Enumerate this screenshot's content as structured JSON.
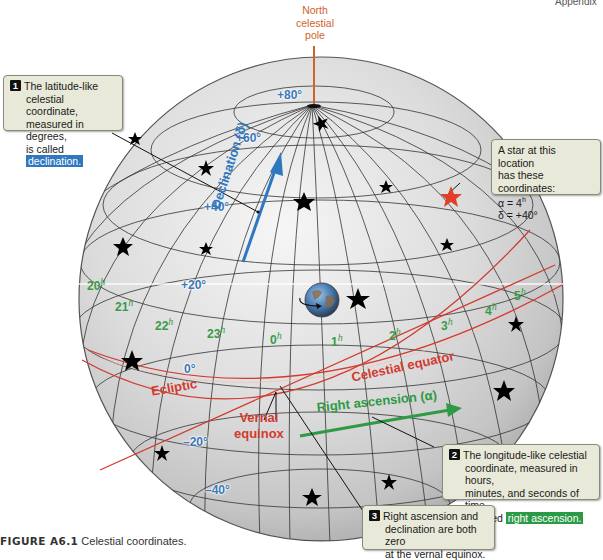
{
  "header": {
    "corner_text": "Appendix"
  },
  "pole": {
    "label_line1": "North",
    "label_line2": "celestial",
    "label_line3": "pole"
  },
  "callouts": {
    "c1": {
      "number": "1",
      "line1": "The latitude-like",
      "line2": "celestial coordinate,",
      "line3": "measured in degrees,",
      "line4_prefix": "is called ",
      "term": "declination."
    },
    "star": {
      "line1": "A star at this location",
      "line2": "has these coordinates:",
      "alpha": "α = 4",
      "alpha_sup": "h",
      "delta": "δ = +40°"
    },
    "c2": {
      "number": "2",
      "line1": "The longitude-like celestial",
      "line2": "coordinate, measured in hours,",
      "line3": "minutes, and seconds of time,",
      "line4_prefix": "is called ",
      "term": "right ascension."
    },
    "c3": {
      "number": "3",
      "line1": "Right ascension and",
      "line2": "declination are both zero",
      "line3": "at the vernal equinox."
    }
  },
  "declination_labels": {
    "p80": "+80°",
    "p60": "+60°",
    "p40": "+40°",
    "p20": "+20°",
    "z0": "0°",
    "m20": "–20°",
    "m40": "–40°"
  },
  "hour_labels": {
    "h20": "20",
    "h21": "21",
    "h22": "22",
    "h23": "23",
    "h0": "0",
    "h1": "1",
    "h2": "2",
    "h3": "3",
    "h4": "4",
    "h5": "5",
    "suffix": "h"
  },
  "axis_labels": {
    "declination": "Declination (δ)",
    "celestial_equator": "Celestial equator",
    "ecliptic": "Ecliptic",
    "vernal_line1": "Vernal",
    "vernal_line2": "equinox",
    "right_ascension": "Right ascension (α)"
  },
  "caption": {
    "figure": "FIGURE A6.1",
    "text": " Celestial coordinates."
  },
  "colors": {
    "declination_blue": "#3a78b8",
    "right_ascension_green": "#2e9a45",
    "ecliptic_red": "#d23b30",
    "pole_orange": "#d0632a",
    "callout_bg": "#e8e9d8",
    "highlighted_star": "#e0402a"
  }
}
